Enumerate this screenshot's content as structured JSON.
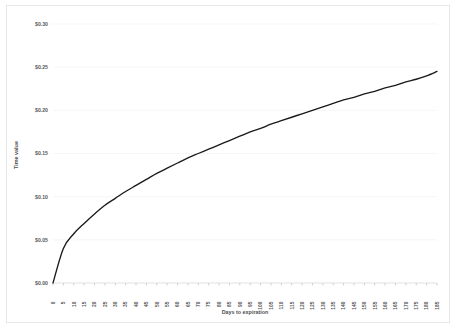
{
  "chart_data": {
    "type": "line",
    "title": "",
    "xlabel": "Days to expiration",
    "ylabel": "Time value",
    "xlim": [
      0,
      185
    ],
    "ylim": [
      0,
      0.3
    ],
    "grid": true,
    "legend": null,
    "line_color": "#1a1a1a",
    "background_color": "#ffffff",
    "gridline_color": "#f2f2f4",
    "tick_label_color": "#5a5a5a",
    "y_tick_labels": [
      "$0.30",
      "$0.25",
      "$0.20",
      "$0.15",
      "$0.10",
      "$0.05",
      "$0.00"
    ],
    "y_tick_values": [
      0.3,
      0.25,
      0.2,
      0.15,
      0.1,
      0.05,
      0.0
    ],
    "x_tick_labels": [
      "0",
      "5",
      "10",
      "15",
      "20",
      "25",
      "30",
      "35",
      "40",
      "45",
      "50",
      "55",
      "60",
      "65",
      "70",
      "75",
      "80",
      "85",
      "90",
      "95",
      "100",
      "105",
      "110",
      "115",
      "120",
      "125",
      "130",
      "135",
      "140",
      "145",
      "150",
      "155",
      "160",
      "165",
      "170",
      "175",
      "180",
      "185"
    ],
    "x": [
      0,
      5,
      10,
      15,
      20,
      25,
      30,
      35,
      40,
      45,
      50,
      55,
      60,
      65,
      70,
      75,
      80,
      85,
      90,
      95,
      100,
      105,
      110,
      115,
      120,
      125,
      130,
      135,
      140,
      145,
      150,
      155,
      160,
      165,
      170,
      175,
      180,
      185
    ],
    "values": [
      0.0,
      0.04,
      0.057,
      0.069,
      0.08,
      0.09,
      0.098,
      0.106,
      0.113,
      0.12,
      0.127,
      0.133,
      0.139,
      0.145,
      0.15,
      0.155,
      0.16,
      0.165,
      0.17,
      0.175,
      0.179,
      0.184,
      0.188,
      0.192,
      0.196,
      0.2,
      0.204,
      0.208,
      0.212,
      0.215,
      0.219,
      0.222,
      0.226,
      0.229,
      0.233,
      0.236,
      0.24,
      0.245
    ],
    "series": [
      {
        "name": "Time value",
        "values": [
          0.0,
          0.04,
          0.057,
          0.069,
          0.08,
          0.09,
          0.098,
          0.106,
          0.113,
          0.12,
          0.127,
          0.133,
          0.139,
          0.145,
          0.15,
          0.155,
          0.16,
          0.165,
          0.17,
          0.175,
          0.179,
          0.184,
          0.188,
          0.192,
          0.196,
          0.2,
          0.204,
          0.208,
          0.212,
          0.215,
          0.219,
          0.222,
          0.226,
          0.229,
          0.233,
          0.236,
          0.24,
          0.245
        ]
      }
    ]
  }
}
